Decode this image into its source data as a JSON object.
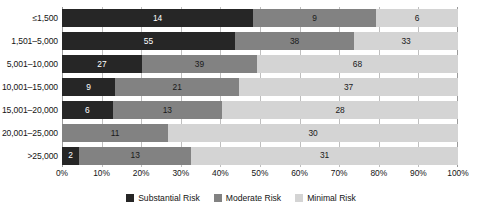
{
  "chart_data": {
    "type": "bar",
    "subtype": "stacked-horizontal-100-percent",
    "title": "",
    "xlabel": "",
    "ylabel": "",
    "xlim": [
      0,
      100
    ],
    "xtick_labels": [
      "0%",
      "10%",
      "20%",
      "30%",
      "40%",
      "50%",
      "60%",
      "70%",
      "80%",
      "90%",
      "100%"
    ],
    "xtick_values": [
      0,
      10,
      20,
      30,
      40,
      50,
      60,
      70,
      80,
      90,
      100
    ],
    "grid": true,
    "legend_position": "bottom-center",
    "categories": [
      "≤1,500",
      "1,501–5,000",
      "5,001–10,000",
      "10,001–15,000",
      "15,001–20,000",
      "20,001–25,000",
      ">25,000"
    ],
    "series": [
      {
        "name": "Substantial Risk",
        "color": "#262626",
        "values": [
          14,
          55,
          27,
          9,
          6,
          null,
          2
        ]
      },
      {
        "name": "Moderate Risk",
        "color": "#828282",
        "values": [
          9,
          38,
          39,
          21,
          13,
          11,
          13
        ]
      },
      {
        "name": "Minimal Risk",
        "color": "#d4d4d4",
        "values": [
          6,
          33,
          68,
          37,
          28,
          30,
          31
        ]
      }
    ],
    "rows": [
      {
        "category": "≤1,500",
        "segments": [
          {
            "series": "Substantial Risk",
            "value": 14,
            "label": "14",
            "pct": 48.28
          },
          {
            "series": "Moderate Risk",
            "value": 9,
            "label": "9",
            "pct": 31.03
          },
          {
            "series": "Minimal Risk",
            "value": 6,
            "label": "6",
            "pct": 20.69
          }
        ]
      },
      {
        "category": "1,501–5,000",
        "segments": [
          {
            "series": "Substantial Risk",
            "value": 55,
            "label": "55",
            "pct": 43.65
          },
          {
            "series": "Moderate Risk",
            "value": 38,
            "label": "38",
            "pct": 30.16
          },
          {
            "series": "Minimal Risk",
            "value": 33,
            "label": "33",
            "pct": 26.19
          }
        ]
      },
      {
        "category": "5,001–10,000",
        "segments": [
          {
            "series": "Substantial Risk",
            "value": 27,
            "label": "27",
            "pct": 20.15
          },
          {
            "series": "Moderate Risk",
            "value": 39,
            "label": "39",
            "pct": 29.1
          },
          {
            "series": "Minimal Risk",
            "value": 68,
            "label": "68",
            "pct": 50.75
          }
        ]
      },
      {
        "category": "10,001–15,000",
        "segments": [
          {
            "series": "Substantial Risk",
            "value": 9,
            "label": "9",
            "pct": 13.43
          },
          {
            "series": "Moderate Risk",
            "value": 21,
            "label": "21",
            "pct": 31.34
          },
          {
            "series": "Minimal Risk",
            "value": 37,
            "label": "37",
            "pct": 55.22
          }
        ]
      },
      {
        "category": "15,001–20,000",
        "segments": [
          {
            "series": "Substantial Risk",
            "value": 6,
            "label": "6",
            "pct": 12.77
          },
          {
            "series": "Moderate Risk",
            "value": 13,
            "label": "13",
            "pct": 27.66
          },
          {
            "series": "Minimal Risk",
            "value": 28,
            "label": "28",
            "pct": 59.57
          }
        ]
      },
      {
        "category": "20,001–25,000",
        "segments": [
          {
            "series": "Moderate Risk",
            "value": 11,
            "label": "11",
            "pct": 26.83
          },
          {
            "series": "Minimal Risk",
            "value": 30,
            "label": "30",
            "pct": 73.17
          }
        ]
      },
      {
        "category": ">25,000",
        "segments": [
          {
            "series": "Substantial Risk",
            "value": 2,
            "label": "2",
            "pct": 4.35
          },
          {
            "series": "Moderate Risk",
            "value": 13,
            "label": "13",
            "pct": 28.26
          },
          {
            "series": "Minimal Risk",
            "value": 31,
            "label": "31",
            "pct": 67.39
          }
        ]
      }
    ],
    "legend": [
      {
        "label": "Substantial Risk",
        "color": "#262626",
        "key": "substantial"
      },
      {
        "label": "Moderate Risk",
        "color": "#828282",
        "key": "moderate"
      },
      {
        "label": "Minimal Risk",
        "color": "#d4d4d4",
        "key": "minimal"
      }
    ]
  }
}
